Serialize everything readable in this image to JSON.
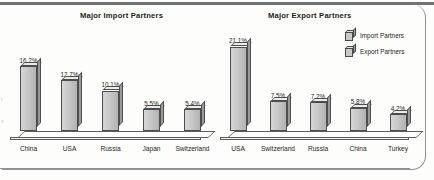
{
  "chart_data": [
    {
      "type": "bar",
      "title": "Major Import Partners",
      "categories": [
        "China",
        "USA",
        "Russia",
        "Japan",
        "Switzerland"
      ],
      "values": [
        16.2,
        12.7,
        10.1,
        5.5,
        5.4
      ],
      "value_labels": [
        "16.2%",
        "12.7%",
        "10.1%",
        "5.5%",
        "5.4%"
      ],
      "xlabel": "",
      "ylabel": "",
      "ylim": [
        0,
        22
      ],
      "grid": false,
      "series_name": "Import Partners"
    },
    {
      "type": "bar",
      "title": "Major Export Partners",
      "categories": [
        "USA",
        "Switzerland",
        "Russia",
        "China",
        "Turkey"
      ],
      "values": [
        21.1,
        7.5,
        7.2,
        5.8,
        4.2
      ],
      "value_labels": [
        "21.1%",
        "7.5%",
        "7.2%",
        "5.8%",
        "4.2%"
      ],
      "xlabel": "",
      "ylabel": "",
      "ylim": [
        0,
        22
      ],
      "grid": false,
      "series_name": "Export Partners"
    }
  ],
  "legend": {
    "position": "top-right",
    "entries": [
      {
        "label": "Import Partners",
        "icon": "cube-swatch-icon"
      },
      {
        "label": "Export Partners",
        "icon": "cube-swatch-icon"
      }
    ]
  },
  "colors": {
    "bar_front": "#c4c4c4",
    "bar_top": "#ececec",
    "bar_side": "#9a9a9a",
    "outline": "#4d4d4d",
    "frame": "#8e9295",
    "rule": "#6f7376",
    "text": "#1d1d1d",
    "background": "#fdfdfc"
  }
}
